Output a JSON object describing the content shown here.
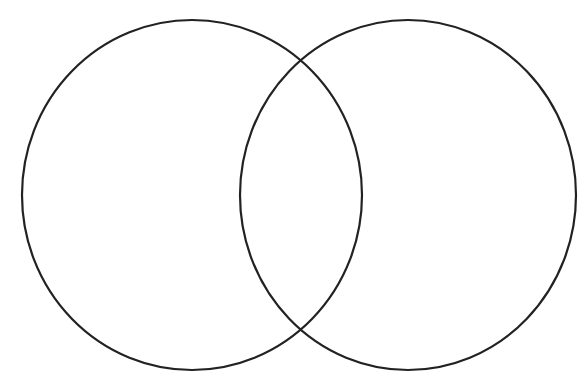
{
  "diagram": {
    "type": "venn",
    "background": "#ffffff",
    "stroke_color": "#222222",
    "stroke_width": 2.2,
    "sets": [
      {
        "id": "left",
        "label": "",
        "cx": 192,
        "cy": 195,
        "rx": 170,
        "ry": 175
      },
      {
        "id": "right",
        "label": "",
        "cx": 408,
        "cy": 195,
        "rx": 168,
        "ry": 175
      }
    ],
    "intersection_label": ""
  }
}
